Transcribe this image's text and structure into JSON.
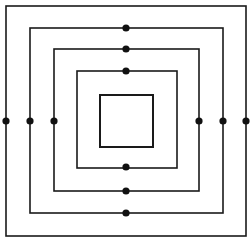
{
  "figure": {
    "canvas": {
      "width": 252,
      "height": 242,
      "background": "#ffffff"
    },
    "stroke_color": "#1a1a1a",
    "marker_color": "#111111",
    "squares": [
      {
        "id": "square-1-outer",
        "label": "Outer square",
        "x": 6,
        "y": 6,
        "width": 240,
        "height": 230,
        "stroke_width": 1.6
      },
      {
        "id": "square-2",
        "label": "Second square",
        "x": 30,
        "y": 28,
        "width": 193,
        "height": 185,
        "stroke_width": 1.6
      },
      {
        "id": "square-3",
        "label": "Third square",
        "x": 54,
        "y": 49,
        "width": 145,
        "height": 142,
        "stroke_width": 1.6
      },
      {
        "id": "square-4",
        "label": "Fourth square",
        "x": 77,
        "y": 71,
        "width": 100,
        "height": 97,
        "stroke_width": 1.6
      },
      {
        "id": "square-5-inner",
        "label": "Innermost square",
        "x": 100,
        "y": 95,
        "width": 53,
        "height": 52,
        "stroke_width": 2.0
      }
    ],
    "markers": {
      "radius": 3.6,
      "points": [
        {
          "id": "marker-top-square-2",
          "label": "Top midpoint of second square",
          "x": 126,
          "y": 28
        },
        {
          "id": "marker-top-square-3",
          "label": "Top midpoint of third square",
          "x": 126,
          "y": 49
        },
        {
          "id": "marker-top-square-4",
          "label": "Top midpoint of fourth square",
          "x": 126,
          "y": 71
        },
        {
          "id": "marker-bottom-square-4",
          "label": "Bottom midpoint of fourth square",
          "x": 126,
          "y": 167
        },
        {
          "id": "marker-bottom-square-3",
          "label": "Bottom midpoint of third square",
          "x": 126,
          "y": 191
        },
        {
          "id": "marker-bottom-square-2",
          "label": "Bottom midpoint of second square",
          "x": 126,
          "y": 213
        },
        {
          "id": "marker-left-square-1",
          "label": "Left midpoint of outer square",
          "x": 6,
          "y": 121
        },
        {
          "id": "marker-left-square-2",
          "label": "Left midpoint of second square",
          "x": 30,
          "y": 121
        },
        {
          "id": "marker-left-square-3",
          "label": "Left midpoint of third square",
          "x": 54,
          "y": 121
        },
        {
          "id": "marker-right-square-3",
          "label": "Right midpoint of third square",
          "x": 199,
          "y": 121
        },
        {
          "id": "marker-right-square-2",
          "label": "Right midpoint of second square",
          "x": 223,
          "y": 121
        },
        {
          "id": "marker-right-square-1",
          "label": "Right midpoint of outer square",
          "x": 246,
          "y": 121
        }
      ]
    }
  }
}
